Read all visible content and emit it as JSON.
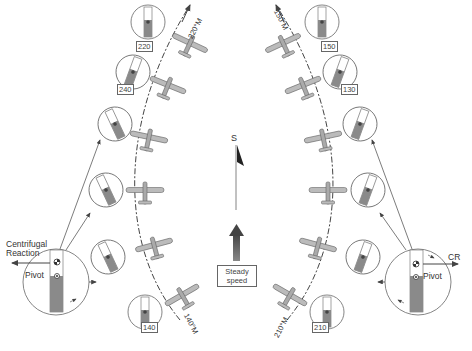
{
  "diagram": {
    "center": {
      "heading_label": "S",
      "speed_label_line1": "Steady",
      "speed_label_line2": "speed"
    },
    "left_turn": {
      "start_heading_label": "140°M",
      "end_heading_label": "220°M",
      "compass_readings": [
        "140",
        "240",
        "220"
      ],
      "pivot_detail": {
        "label_force_line1": "Centrifugal",
        "label_force_line2": "Reaction",
        "label_pivot": "Pivot"
      }
    },
    "right_turn": {
      "start_heading_label": "210°M",
      "end_heading_label": "150°M",
      "compass_readings": [
        "210",
        "130",
        "150"
      ],
      "pivot_detail": {
        "label_force": "CR",
        "label_pivot": "Pivot"
      }
    },
    "colors": {
      "line": "#444444",
      "needle_fill": "#8a8a8a",
      "aircraft": "#9a9a9a",
      "speed_arrow": "#555555"
    }
  }
}
